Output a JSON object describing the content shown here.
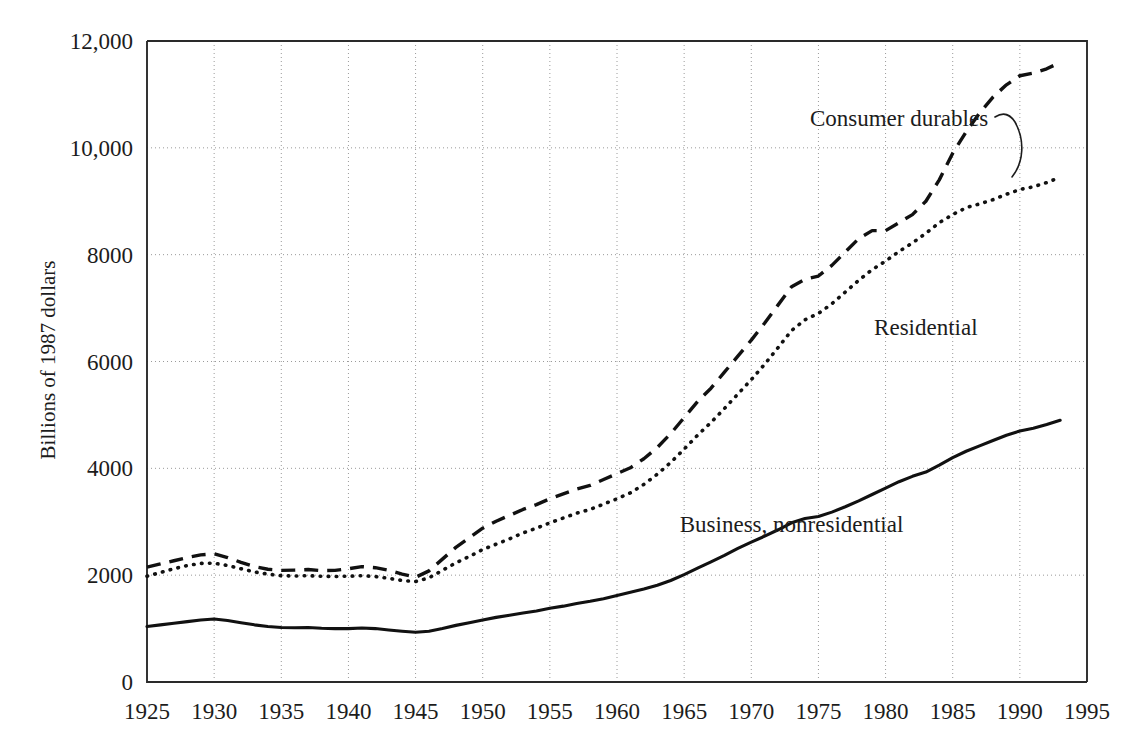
{
  "chart_data": {
    "type": "line",
    "title": "",
    "subtitle": "",
    "xlabel": "",
    "ylabel": "Billions of 1987 dollars",
    "xlim": [
      1925,
      1995
    ],
    "ylim": [
      0,
      12000
    ],
    "grid": true,
    "legend_position": "inline-annotations",
    "x_tick_labels": [
      "1925",
      "1930",
      "1935",
      "1940",
      "1945",
      "1950",
      "1955",
      "1960",
      "1965",
      "1970",
      "1975",
      "1980",
      "1985",
      "1990",
      "1995"
    ],
    "x_ticks": [
      1925,
      1930,
      1935,
      1940,
      1945,
      1950,
      1955,
      1960,
      1965,
      1970,
      1975,
      1980,
      1985,
      1990,
      1995
    ],
    "y_tick_labels": [
      "0",
      "2000",
      "4000",
      "6000",
      "8000",
      "10,000",
      "12,000"
    ],
    "y_ticks": [
      0,
      2000,
      4000,
      6000,
      8000,
      10000,
      12000
    ],
    "x": [
      1925,
      1926,
      1927,
      1928,
      1929,
      1930,
      1931,
      1932,
      1933,
      1934,
      1935,
      1936,
      1937,
      1938,
      1939,
      1940,
      1941,
      1942,
      1943,
      1944,
      1945,
      1946,
      1947,
      1948,
      1949,
      1950,
      1951,
      1952,
      1953,
      1954,
      1955,
      1956,
      1957,
      1958,
      1959,
      1960,
      1961,
      1962,
      1963,
      1964,
      1965,
      1966,
      1967,
      1968,
      1969,
      1970,
      1971,
      1972,
      1973,
      1974,
      1975,
      1976,
      1977,
      1978,
      1979,
      1980,
      1981,
      1982,
      1983,
      1984,
      1985,
      1986,
      1987,
      1988,
      1989,
      1990,
      1991,
      1992,
      1993
    ],
    "series": [
      {
        "name": "Consumer durables",
        "style": "dashed",
        "label_position": "upper-right",
        "values": [
          2150,
          2210,
          2270,
          2330,
          2380,
          2400,
          2330,
          2240,
          2160,
          2110,
          2090,
          2095,
          2105,
          2085,
          2090,
          2120,
          2160,
          2140,
          2090,
          2020,
          1960,
          2080,
          2300,
          2520,
          2700,
          2880,
          3010,
          3120,
          3230,
          3320,
          3430,
          3520,
          3610,
          3680,
          3790,
          3900,
          4010,
          4180,
          4390,
          4650,
          4950,
          5250,
          5500,
          5800,
          6100,
          6400,
          6720,
          7060,
          7400,
          7540,
          7600,
          7800,
          8050,
          8300,
          8450,
          8450,
          8600,
          8750,
          9000,
          9400,
          9900,
          10300,
          10650,
          10950,
          11180,
          11350,
          11400,
          11480,
          11600
        ]
      },
      {
        "name": "Residential",
        "style": "dotted",
        "label_position": "middle-right",
        "values": [
          1980,
          2050,
          2120,
          2180,
          2220,
          2225,
          2180,
          2120,
          2060,
          2020,
          1990,
          1985,
          1990,
          1980,
          1975,
          1980,
          1990,
          1975,
          1940,
          1900,
          1880,
          1950,
          2090,
          2230,
          2350,
          2480,
          2580,
          2680,
          2790,
          2880,
          2980,
          3070,
          3160,
          3230,
          3330,
          3430,
          3540,
          3700,
          3890,
          4110,
          4360,
          4620,
          4860,
          5120,
          5390,
          5660,
          5950,
          6260,
          6580,
          6780,
          6900,
          7080,
          7300,
          7520,
          7720,
          7880,
          8060,
          8220,
          8400,
          8600,
          8750,
          8880,
          8950,
          9030,
          9130,
          9220,
          9270,
          9350,
          9450
        ]
      },
      {
        "name": "Business, nonresidential",
        "style": "solid",
        "label_position": "lower-right",
        "values": [
          1040,
          1070,
          1100,
          1130,
          1160,
          1180,
          1150,
          1110,
          1070,
          1040,
          1020,
          1015,
          1020,
          1005,
          1000,
          1000,
          1010,
          1000,
          975,
          950,
          930,
          950,
          1000,
          1060,
          1110,
          1160,
          1210,
          1250,
          1290,
          1330,
          1380,
          1420,
          1470,
          1510,
          1560,
          1620,
          1680,
          1740,
          1810,
          1900,
          2010,
          2130,
          2250,
          2370,
          2500,
          2620,
          2730,
          2850,
          2980,
          3060,
          3100,
          3180,
          3280,
          3390,
          3510,
          3630,
          3750,
          3850,
          3930,
          4060,
          4200,
          4320,
          4420,
          4520,
          4620,
          4700,
          4750,
          4820,
          4900
        ]
      }
    ],
    "annotations": [
      {
        "text": "Consumer durables",
        "x": 1981,
        "y": 10400
      },
      {
        "text": "Residential",
        "x": 1983,
        "y": 6500
      },
      {
        "text": "Business, nonresidential",
        "x": 1973,
        "y": 2800
      }
    ]
  }
}
